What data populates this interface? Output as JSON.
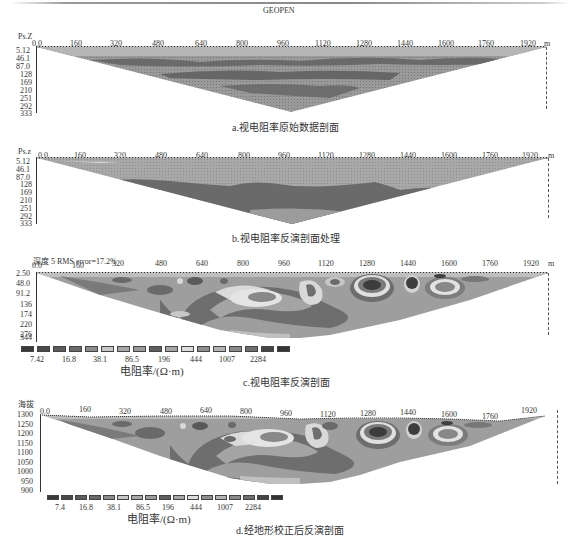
{
  "figure": {
    "x_ticks": [
      "0.0",
      "160",
      "320",
      "480",
      "640",
      "800",
      "960",
      "1120",
      "1280",
      "1440",
      "1600",
      "1760",
      "1920"
    ],
    "x_unit": "m",
    "panels": [
      {
        "id": "a",
        "software_label": "GEOPEN",
        "y_label": "Ps.Z",
        "y_ticks": [
          "5.12",
          "46.1",
          "87.0",
          "128",
          "169",
          "210",
          "251",
          "292",
          "333"
        ],
        "caption": "a.视电阻率原始数据剖面"
      },
      {
        "id": "b",
        "y_label": "Ps.z",
        "y_ticks": [
          "5.12",
          "46.1",
          "87.0",
          "128",
          "169",
          "210",
          "251",
          "292",
          "333"
        ],
        "caption": "b.视电阻率反演剖面处理"
      },
      {
        "id": "c",
        "header": "深度 5 RMS error=17.2%",
        "y_ticks": [
          "2.50",
          "48.0",
          "91.2",
          "136",
          "174",
          "220",
          "276",
          "344"
        ],
        "legend_labels": [
          "7.42",
          "16.8",
          "38.1",
          "86.5",
          "196",
          "444",
          "1007",
          "2284"
        ],
        "legend_unit": "电阻率/(Ω·m)",
        "caption": "c.视电阻率反演剖面"
      },
      {
        "id": "d",
        "y_label": "海拔",
        "y_ticks": [
          "1300",
          "1250",
          "1200",
          "1150",
          "1100",
          "1050",
          "1000",
          "950",
          "900"
        ],
        "legend_labels": [
          "7.4",
          "16.8",
          "38.1",
          "86.5",
          "196",
          "444",
          "1007",
          "2284"
        ],
        "legend_unit": "电阻率/(Ω·m)",
        "caption": "d.经地形校正后反演剖面"
      }
    ],
    "legend_colors": [
      "#3a3a3a",
      "#4a4a4a",
      "#5c5c5c",
      "#6a6a6a",
      "#8c8c8c",
      "#c8c8c8",
      "#a8a8a8",
      "#9a9a9a",
      "#5e5e5e",
      "#a6a6a6",
      "#dcdcdc",
      "#8e8e8e",
      "#b4b4b4",
      "#8a8a8a",
      "#6e6e6e",
      "#444444",
      "#333333"
    ]
  }
}
